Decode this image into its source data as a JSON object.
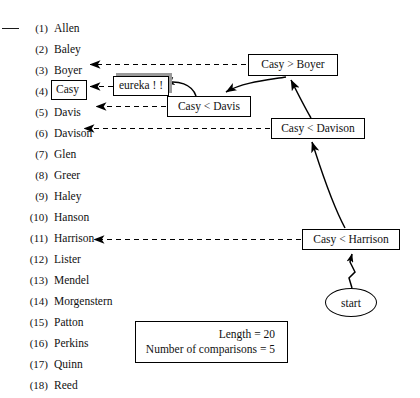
{
  "figure": {
    "kind": "binary-search-trace-diagram",
    "margin_tick": "—"
  },
  "name_list": {
    "entries": [
      {
        "num": "(1)",
        "name": "Allen",
        "boxed": false
      },
      {
        "num": "(2)",
        "name": "Baley",
        "boxed": false
      },
      {
        "num": "(3)",
        "name": "Boyer",
        "boxed": false
      },
      {
        "num": "(4)",
        "name": "Casy",
        "boxed": true
      },
      {
        "num": "(5)",
        "name": "Davis",
        "boxed": false
      },
      {
        "num": "(6)",
        "name": "Davison",
        "boxed": false
      },
      {
        "num": "(7)",
        "name": "Glen",
        "boxed": false
      },
      {
        "num": "(8)",
        "name": "Greer",
        "boxed": false
      },
      {
        "num": "(9)",
        "name": "Haley",
        "boxed": false
      },
      {
        "num": "(10)",
        "name": "Hanson",
        "boxed": false
      },
      {
        "num": "(11)",
        "name": "Harrison",
        "boxed": false
      },
      {
        "num": "(12)",
        "name": "Lister",
        "boxed": false
      },
      {
        "num": "(13)",
        "name": "Mendel",
        "boxed": false
      },
      {
        "num": "(14)",
        "name": "Morgenstern",
        "boxed": false
      },
      {
        "num": "(15)",
        "name": "Patton",
        "boxed": false
      },
      {
        "num": "(16)",
        "name": "Perkins",
        "boxed": false
      },
      {
        "num": "(17)",
        "name": "Quinn",
        "boxed": false
      },
      {
        "num": "(18)",
        "name": "Reed",
        "boxed": false
      }
    ]
  },
  "nodes": {
    "eureka": {
      "label": "eureka ! !"
    },
    "casy_gt_boyer": {
      "label": "Casy > Boyer"
    },
    "casy_lt_davis": {
      "label": "Casy < Davis"
    },
    "casy_lt_davison": {
      "label": "Casy < Davison"
    },
    "casy_lt_harrison": {
      "label": "Casy < Harrison"
    },
    "start": {
      "label": "start"
    }
  },
  "legend": {
    "length_line": "Length = 20",
    "comparisons_line": "Number of comparisons = 5"
  },
  "colors": {
    "ink": "#111111",
    "shadow": "#9a9a9a",
    "paper": "#ffffff"
  }
}
